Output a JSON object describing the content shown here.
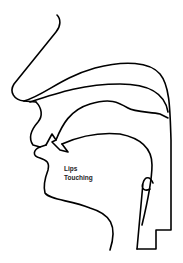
{
  "diagram": {
    "label_lines": [
      "Lips",
      "Touching"
    ],
    "stroke_color": "#000000",
    "background": "#ffffff"
  }
}
